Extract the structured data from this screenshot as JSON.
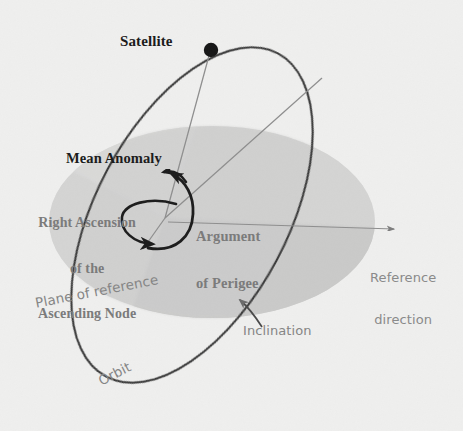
{
  "figure": {
    "background_color": "#efefee",
    "width": 463,
    "height": 431
  },
  "colors": {
    "background": "#efefee",
    "plane_fill": "#d4d4d3",
    "plane_fill_dark": "#c6c6c5",
    "orbit_stroke": "#3a3a3a",
    "radial_line": "#8c8c8c",
    "arrow_black": "#1e1e1e",
    "text_dark": "#1c1c1c",
    "text_gray": "#7b7b7b",
    "text_light": "#8a8a8a"
  },
  "labels": {
    "satellite": "Satellite",
    "mean_anomaly": "Mean Anomaly",
    "raan_line1": "Right Ascension",
    "raan_line2": "of the",
    "raan_line3": "Ascending Node",
    "argument_of_perigee_line1": "Argument",
    "argument_of_perigee_line2": "of Perigee",
    "reference_direction_line1": "Reference",
    "reference_direction_line2": "direction",
    "plane_of_reference": "Plane of reference",
    "inclination": "Inclination",
    "orbit": "Orbit"
  },
  "elements": {
    "satellite_marker": "filled-circle",
    "focus_point": "orbit-focus",
    "reference_direction_arrow": "arrow-right",
    "raan_arc": "curved-arrow-counterclockwise",
    "argument_of_perigee_arc": "curved-arrow",
    "mean_anomaly_arc": "curved-arrow",
    "inclination_pointer": "leader-arrow"
  },
  "geometry": {
    "satellite_point": [
      211,
      50
    ],
    "focus_point": [
      165,
      218
    ],
    "reference_arrow_tip": [
      396,
      229
    ],
    "plane_ellipse_center": [
      212,
      222
    ],
    "plane_ellipse_rx": 163,
    "plane_ellipse_ry": 96,
    "orbit_ellipse_center": [
      192,
      215
    ],
    "orbit_ellipse_rx": 96,
    "orbit_ellipse_ry": 183,
    "orbit_rotation_deg": 28
  }
}
